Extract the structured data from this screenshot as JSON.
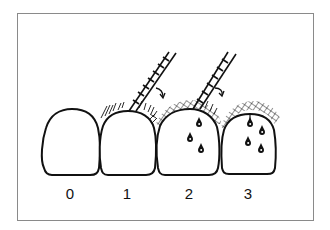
{
  "diagram": {
    "title": "",
    "stages": [
      {
        "label": "0",
        "probe": false,
        "inflammation": "none",
        "bleeding_drops": 0
      },
      {
        "label": "1",
        "probe": true,
        "inflammation": "mild",
        "bleeding_drops": 0
      },
      {
        "label": "2",
        "probe": true,
        "inflammation": "moderate",
        "bleeding_drops": 3
      },
      {
        "label": "3",
        "probe": false,
        "inflammation": "severe",
        "bleeding_drops": 4
      }
    ],
    "colors": {
      "ink": "#111111",
      "frame": "#8a8a8a",
      "background": "#ffffff"
    }
  }
}
